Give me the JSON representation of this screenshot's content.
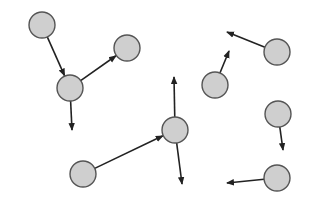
{
  "diagram": {
    "colors": {
      "node_fill": "#cfcfcf",
      "node_stroke": "#555555",
      "arrow": "#222222",
      "background": "#ffffff"
    },
    "nodes": [
      {
        "id": "n1"
      },
      {
        "id": "n2"
      },
      {
        "id": "n3"
      },
      {
        "id": "n4"
      },
      {
        "id": "n5"
      },
      {
        "id": "n6"
      },
      {
        "id": "n7"
      },
      {
        "id": "n8"
      },
      {
        "id": "n9"
      }
    ],
    "edges": [
      {
        "from": "n1",
        "to": "n2",
        "type": "node-to-node"
      },
      {
        "from": "n2",
        "to": "n3",
        "type": "node-to-node"
      },
      {
        "from": "n2",
        "direction": "down",
        "type": "vector"
      },
      {
        "from": "n4",
        "direction": "left-up",
        "type": "vector"
      },
      {
        "from": "n5",
        "direction": "up-right",
        "type": "vector"
      },
      {
        "from": "n6",
        "direction": "up",
        "type": "vector"
      },
      {
        "from": "n6",
        "direction": "down-right",
        "type": "vector"
      },
      {
        "from": "n7",
        "to": "n6",
        "type": "node-to-node"
      },
      {
        "from": "n8",
        "direction": "down",
        "type": "vector"
      },
      {
        "from": "n9",
        "direction": "left",
        "type": "vector"
      }
    ]
  }
}
